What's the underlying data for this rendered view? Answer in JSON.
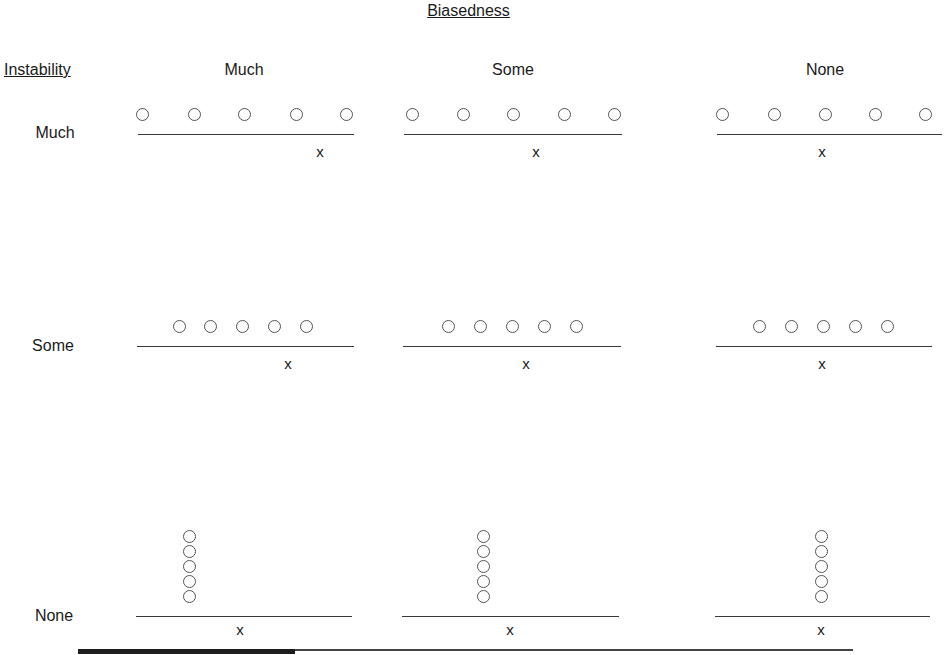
{
  "title": "Biasedness",
  "row_header": "Instability",
  "columns": [
    {
      "label": "Much",
      "center_x": 244
    },
    {
      "label": "Some",
      "center_x": 513
    },
    {
      "label": "None",
      "center_x": 825
    }
  ],
  "rows": [
    {
      "label": "Much",
      "label_y": 124
    },
    {
      "label": "Some",
      "label_y": 337
    },
    {
      "label": "None",
      "label_y": 607
    }
  ],
  "marker_symbol": "x",
  "cells": [
    {
      "row": "Much",
      "col": "Much",
      "layout": "spread",
      "circles_x": [
        142,
        194,
        244,
        296,
        346
      ],
      "circle_y": 114,
      "line": [
        138,
        354
      ],
      "line_y": 134,
      "x_pos": 320,
      "x_y": 153
    },
    {
      "row": "Much",
      "col": "Some",
      "layout": "spread",
      "circles_x": [
        412,
        463,
        513,
        564,
        614
      ],
      "circle_y": 114,
      "line": [
        404,
        622
      ],
      "line_y": 134,
      "x_pos": 536,
      "x_y": 153
    },
    {
      "row": "Much",
      "col": "None",
      "layout": "spread",
      "circles_x": [
        722,
        774,
        825,
        875,
        925
      ],
      "circle_y": 114,
      "line": [
        717,
        942
      ],
      "line_y": 134,
      "x_pos": 822,
      "x_y": 153
    },
    {
      "row": "Some",
      "col": "Much",
      "layout": "clustered",
      "circles_x": [
        179,
        210,
        242,
        274,
        306
      ],
      "circle_y": 326,
      "line": [
        137,
        354
      ],
      "line_y": 346,
      "x_pos": 288,
      "x_y": 365
    },
    {
      "row": "Some",
      "col": "Some",
      "layout": "clustered",
      "circles_x": [
        448,
        480,
        512,
        544,
        576
      ],
      "circle_y": 326,
      "line": [
        403,
        621
      ],
      "line_y": 346,
      "x_pos": 526,
      "x_y": 365
    },
    {
      "row": "Some",
      "col": "None",
      "layout": "clustered",
      "circles_x": [
        759,
        791,
        823,
        855,
        887
      ],
      "circle_y": 326,
      "line": [
        716,
        932
      ],
      "line_y": 346,
      "x_pos": 822,
      "x_y": 365
    },
    {
      "row": "None",
      "col": "Much",
      "layout": "stacked",
      "circle_x": 189,
      "circles_y": [
        536,
        551,
        566,
        581,
        596
      ],
      "line": [
        136,
        352
      ],
      "line_y": 616,
      "x_pos": 240,
      "x_y": 631
    },
    {
      "row": "None",
      "col": "Some",
      "layout": "stacked",
      "circle_x": 483,
      "circles_y": [
        536,
        551,
        566,
        581,
        596
      ],
      "line": [
        402,
        619
      ],
      "line_y": 616,
      "x_pos": 510,
      "x_y": 631
    },
    {
      "row": "None",
      "col": "None",
      "layout": "stacked",
      "circle_x": 821,
      "circles_y": [
        536,
        551,
        566,
        581,
        596
      ],
      "line": [
        715,
        930
      ],
      "line_y": 616,
      "x_pos": 821,
      "x_y": 631
    }
  ],
  "bottom_bar": {
    "thick": [
      78,
      295
    ],
    "thin_end": 853,
    "y": 651
  },
  "colors": {
    "ink": "#1a1a1a",
    "circle_stroke": "#555555",
    "background": "#ffffff"
  }
}
